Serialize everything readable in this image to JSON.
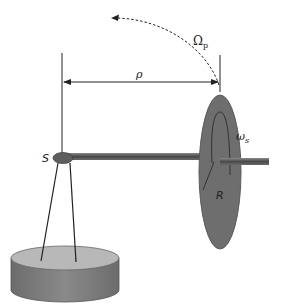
{
  "figure": {
    "labels": {
      "precession_rate": "Ω",
      "precession_rate_sub": "p",
      "lever_arm": "ρ",
      "spin_rate": "ω",
      "spin_rate_sub": "s",
      "pivot": "S",
      "disk_radius": "R"
    },
    "colors": {
      "disk": "#6e6e6e",
      "disk_edge": "#5a5a5a",
      "axle": "#555555",
      "base_top": "#b5b5b5",
      "base_side": "#7a7a7a",
      "lines": "#222222"
    }
  }
}
